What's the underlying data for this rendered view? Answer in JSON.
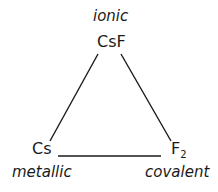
{
  "diagram": {
    "vertices": {
      "top": {
        "formula": "CsF",
        "bond_type": "ionic"
      },
      "bottom_left": {
        "formula": "Cs",
        "bond_type": "metallic"
      },
      "bottom_right": {
        "formula_base": "F",
        "formula_subscript": "2",
        "bond_type": "covalent"
      }
    },
    "edges": [
      {
        "from": "top",
        "to": "bottom_left"
      },
      {
        "from": "top",
        "to": "bottom_right"
      },
      {
        "from": "bottom_left",
        "to": "bottom_right"
      }
    ],
    "line_color": "#1a1a1a"
  }
}
